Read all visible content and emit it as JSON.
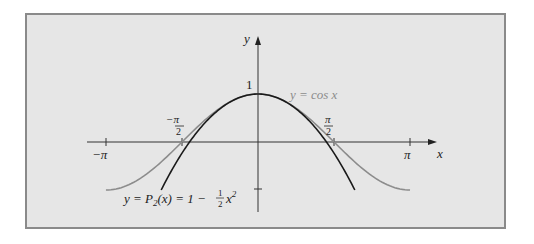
{
  "chart_data": {
    "type": "line",
    "title": "",
    "xlabel": "x",
    "ylabel": "y",
    "xlim": [
      -3.5,
      3.8
    ],
    "ylim": [
      -1.5,
      2.2
    ],
    "grid": false,
    "x_ticks": [
      {
        "value": -3.14159,
        "label": "−π"
      },
      {
        "value": -1.5708,
        "label": "−π/2"
      },
      {
        "value": 1.5708,
        "label": "π/2"
      },
      {
        "value": 3.14159,
        "label": "π"
      }
    ],
    "y_ticks": [
      {
        "value": 1,
        "label": "1"
      },
      {
        "value": -1,
        "label": ""
      }
    ],
    "series": [
      {
        "name": "y = cos x",
        "color": "#8c8c8c",
        "function": "cos(x)",
        "domain": [
          -3.14159,
          3.14159
        ],
        "x": [
          -3.14159,
          -2.356,
          -1.5708,
          -0.785,
          0,
          0.785,
          1.5708,
          2.356,
          3.14159
        ],
        "values": [
          -1,
          -0.707,
          0,
          0.707,
          1,
          0.707,
          0,
          -0.707,
          -1
        ]
      },
      {
        "name": "y = P2(x) = 1 − ½x²",
        "color": "#1a1a1a",
        "function": "1 - x^2/2",
        "domain": [
          -2,
          2
        ],
        "x": [
          -2,
          -1.5,
          -1,
          -0.5,
          0,
          0.5,
          1,
          1.5,
          2
        ],
        "values": [
          -1,
          -0.125,
          0.5,
          0.875,
          1,
          0.875,
          0.5,
          -0.125,
          -1
        ]
      }
    ],
    "annotations": [
      {
        "text": "y = cos x",
        "near": "right of peak"
      },
      {
        "text": "y = P₂(x) = 1 − ½x²",
        "near": "lower left"
      }
    ]
  },
  "labels": {
    "x_axis": "x",
    "y_axis": "y",
    "tick_neg_pi": "−π",
    "tick_pi": "π",
    "tick_neg_half_pi_num": "−π",
    "tick_half_pi_num": "π",
    "tick_half_den": "2",
    "tick_one": "1",
    "cos_label": "y = cos x",
    "p2_label_prefix": "y = P",
    "p2_label_sub": "2",
    "p2_label_mid": "(x) = 1 − ",
    "p2_frac_num": "1",
    "p2_frac_den": "2",
    "p2_label_x": "x",
    "p2_label_sup": "2"
  },
  "colors": {
    "background": "#e6e6e6",
    "frame": "#8a8a8a",
    "axis": "#333333",
    "cos_curve": "#8c8c8c",
    "p2_curve": "#1a1a1a"
  }
}
